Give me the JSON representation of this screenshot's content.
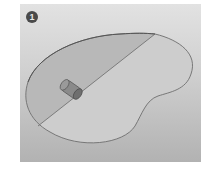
{
  "figure": {
    "step_number": "1",
    "colors": {
      "panel_top": "#e2e2e2",
      "panel_bottom": "#b2b2b2",
      "outline": "#6e6e6e",
      "shaded_region": "#b8b8b8",
      "cylinder": "#7a7a7a"
    }
  }
}
